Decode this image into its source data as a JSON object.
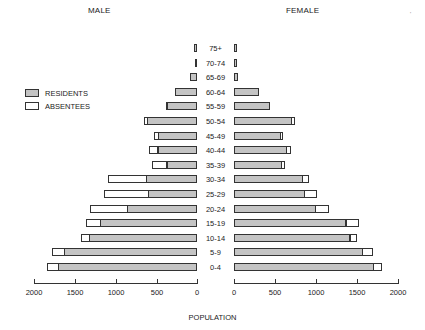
{
  "chart_data": {
    "type": "bar",
    "subtype": "population-pyramid (stacked horizontal)",
    "title": "",
    "left_header": "MALE",
    "right_header": "FEMALE",
    "xlabel": "POPULATION",
    "ylabel": "",
    "xlim": [
      0,
      2000
    ],
    "x_ticks": [
      "2000",
      "1500",
      "1000",
      "500",
      "0",
      "0",
      "500",
      "1000",
      "1500",
      "2000"
    ],
    "grid": false,
    "legend": {
      "position": "upper-left",
      "entries": [
        "RESIDENTS",
        "ABSENTEES"
      ]
    },
    "categories": [
      "75+",
      "70-74",
      "65-69",
      "60-64",
      "55-59",
      "50-54",
      "45-49",
      "40-44",
      "35-39",
      "30-34",
      "25-29",
      "20-24",
      "15-19",
      "10-14",
      "5-9",
      "0-4"
    ],
    "series": [
      {
        "name": "Male residents",
        "values": [
          35,
          30,
          85,
          270,
          365,
          610,
          470,
          480,
          370,
          625,
          595,
          850,
          1185,
          1320,
          1625,
          1695
        ]
      },
      {
        "name": "Male absentees",
        "values": [
          0,
          0,
          0,
          0,
          15,
          40,
          55,
          105,
          180,
          465,
          540,
          460,
          165,
          100,
          140,
          135
        ]
      },
      {
        "name": "Female residents",
        "values": [
          40,
          30,
          50,
          300,
          445,
          710,
          575,
          645,
          580,
          845,
          865,
          1000,
          1370,
          1420,
          1575,
          1710
        ]
      },
      {
        "name": "Female absentees",
        "values": [
          0,
          0,
          0,
          0,
          0,
          35,
          25,
          45,
          40,
          75,
          145,
          160,
          155,
          75,
          125,
          90
        ]
      }
    ]
  },
  "labels": {
    "male": "MALE",
    "female": "FEMALE",
    "legend_residents": "RESIDENTS",
    "legend_absentees": "ABSENTEES",
    "xlabel": "POPULATION",
    "corner_mark": "'"
  },
  "colors": {
    "residents": "#c4c4c4",
    "absentees": "#ffffff",
    "outline": "#333333"
  }
}
